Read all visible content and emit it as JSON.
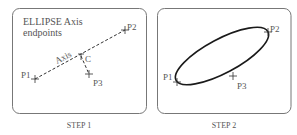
{
  "panels": [
    {
      "id": "step1",
      "caption": "STEP 1",
      "title_line1": "ELLIPSE Axis",
      "title_line2": "endpoints",
      "axis_label": "Axis",
      "points": {
        "p1": {
          "label": "P1",
          "x": 35,
          "y": 79
        },
        "p2": {
          "label": "P2",
          "x": 125,
          "y": 30
        },
        "p3": {
          "label": "P3",
          "x": 89,
          "y": 74
        },
        "c": {
          "label": "C",
          "x": 81,
          "y": 56
        }
      }
    },
    {
      "id": "step2",
      "caption": "STEP 2",
      "points": {
        "p1": {
          "label": "P1",
          "x": 177,
          "y": 80
        },
        "p2": {
          "label": "P2",
          "x": 268,
          "y": 32
        },
        "p3": {
          "label": "P3",
          "x": 233,
          "y": 76
        }
      },
      "ellipse": {
        "cx": 222,
        "cy": 56,
        "rx": 52,
        "ry": 17,
        "rotation": -28
      }
    }
  ],
  "colors": {
    "frame": "#777777",
    "ellipse": "#1a1a1a",
    "dashed_line": "#333333",
    "text": "#555555"
  }
}
